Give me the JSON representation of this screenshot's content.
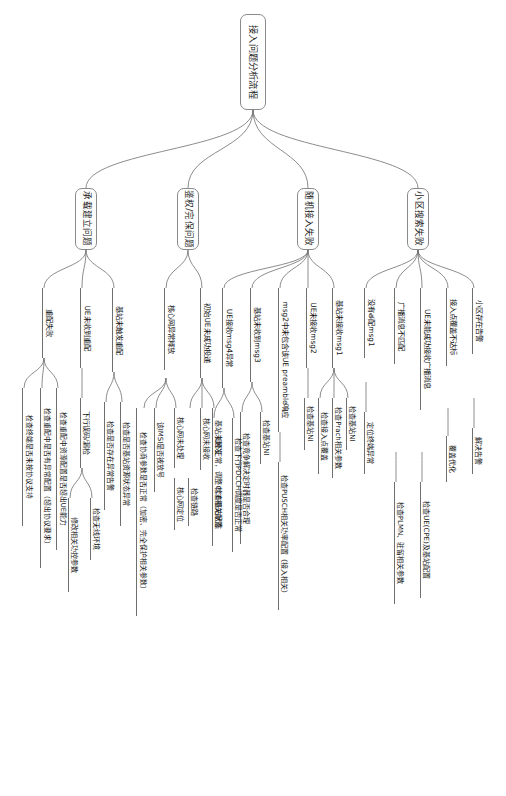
{
  "diagram": {
    "type": "mindmap",
    "title": "接入问题分析流程",
    "orientation": "rotated-90",
    "colors": {
      "stroke": "#6f6f6f",
      "node_border": "#8a8a8a",
      "text": "#1a1a1a",
      "background": "#ffffff"
    },
    "root": {
      "label": "接入问题分析流程"
    },
    "branches": [
      {
        "id": "cell-search",
        "label": "小区搜索失败",
        "children": [
          {
            "label": "小区存在告警",
            "children": [
              {
                "label": "解决告警"
              }
            ]
          },
          {
            "label": "接入点覆盖不达标",
            "children": [
              {
                "label": "覆盖优化"
              }
            ]
          },
          {
            "label": "UE未能成功接收广播消息",
            "children": [
              {
                "label": "检查UE(CPE)及基站配置"
              }
            ]
          },
          {
            "label": "广播消息不匹配",
            "children": [
              {
                "label": "检查PLMN、驻留相关参数"
              }
            ]
          },
          {
            "label": "没有త配msg1",
            "children": [
              {
                "label": "定位终端异常"
              }
            ]
          }
        ]
      },
      {
        "id": "random-access",
        "label": "随机接入失败",
        "children": [
          {
            "label": "基站未接收msg1",
            "children": [
              {
                "label": "检查基站NI"
              },
              {
                "label": "检查Prach相关参数"
              },
              {
                "label": "检查接入点覆盖"
              }
            ]
          },
          {
            "label": "UE未接收msg2",
            "children": [
              {
                "label": "检查基站NI"
              },
              {
                "label": "检查Prach相关参数"
              },
              {
                "label": "检查接入点覆盖（接入相关）"
              }
            ]
          },
          {
            "label": "msg2中未包含该UE preamble响应",
            "children": [
              {
                "label": "检查PUSCH相关功率配置（接入相关）"
              }
            ]
          },
          {
            "label": "基站未收到msg3",
            "children": [
              {
                "label": "检查基站NI"
              },
              {
                "label": "检查竞争解决定时器是否合理"
              }
            ]
          },
          {
            "label": "UE接收msg4异常",
            "children": [
              {
                "label": "检查下行PDCCH调度是否正常"
              },
              {
                "label": "如不正常，调整CCE相关配置"
              }
            ]
          }
        ]
      },
      {
        "id": "auth-integrity",
        "label": "鉴权/完保问题",
        "children": [
          {
            "label": "初始UE未成功投递",
            "children": [
              {
                "label": "基站未触发"
              },
              {
                "label": "核心网未接收"
              },
              {
                "label": "检查基站状态"
              },
              {
                "label": "检查链路"
              }
            ]
          },
          {
            "label": "核心网异常释放",
            "children": [
              {
                "label": "核心网未处理"
              },
              {
                "label": "核心网定位"
              },
              {
                "label": "该IMSI是否被放号"
              },
              {
                "label": "检查协商参数是否正常（加密、完全保护相关参数）"
              }
            ]
          }
        ]
      },
      {
        "id": "bearer-setup",
        "label": "承载建立问题",
        "children": [
          {
            "label": "基站未触发重配",
            "children": [
              {
                "label": "检查是否基站资源状态异常"
              },
              {
                "label": "检查是否存在异常告警"
              }
            ]
          },
          {
            "label": "UE未收到重配",
            "children": [
              {
                "label": "下行误码/漏检"
              },
              {
                "label": "检查无线环境"
              },
              {
                "label": "修改相关功控参数"
              }
            ]
          },
          {
            "label": "重配失败",
            "children": [
              {
                "label": "检查重配中资源配置是否超出UE能力"
              },
              {
                "label": "检查重配中是否有异常配置（超出协议要求）"
              },
              {
                "label": "检查终端是否未按协议支持"
              }
            ]
          }
        ]
      }
    ]
  }
}
